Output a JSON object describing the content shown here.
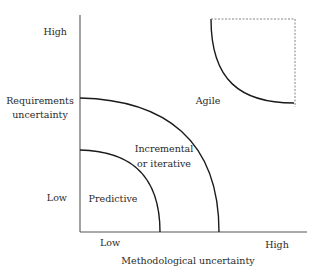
{
  "diagram": {
    "type": "quadrant-curves",
    "y_axis": {
      "title_line1": "Requirements",
      "title_line2": "uncertainty",
      "high_label": "High",
      "low_label": "Low"
    },
    "x_axis": {
      "title": "Methodological uncertainty",
      "low_label": "Low",
      "high_label": "High"
    },
    "regions": [
      {
        "id": "predictive",
        "label": "Predictive"
      },
      {
        "id": "incremental",
        "label_line1": "Incremental",
        "label_line2": "or iterative"
      },
      {
        "id": "agile",
        "label": "Agile"
      }
    ],
    "colors": {
      "curve": "#1a1a1a",
      "axis": "#555555",
      "dashed_box": "#777777",
      "text": "#2a2a2a"
    }
  }
}
